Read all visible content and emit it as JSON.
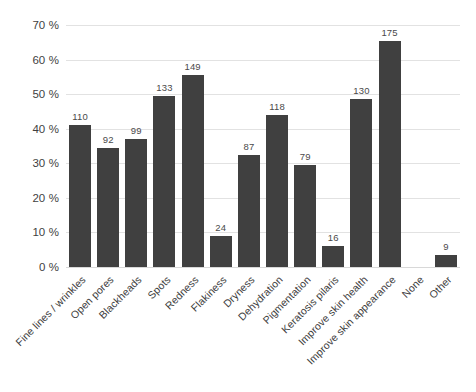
{
  "chart_data": {
    "type": "bar",
    "title": "",
    "subtitle": "",
    "xlabel": "",
    "ylabel": "",
    "ylim": [
      0,
      70
    ],
    "ytick_step": 10,
    "ytick_suffix": " %",
    "grid": true,
    "legend": "none",
    "orientation": "vertical",
    "bar_color": "#404040",
    "gridline_color": "#e2e2e2",
    "background": "#ffffff",
    "base_n": 268,
    "value_labels_shown": true,
    "categories": [
      "Fine lines / wrinkles",
      "Open pores",
      "Blackheads",
      "Spots",
      "Redness",
      "Flakiness",
      "Dryness",
      "Dehydration",
      "Pigmentation",
      "Keratosis pilaris",
      "Improve skin health",
      "Improve skin appearance",
      "None",
      "Other"
    ],
    "counts": [
      110,
      92,
      99,
      133,
      149,
      24,
      87,
      118,
      79,
      16,
      130,
      175,
      0,
      9
    ],
    "percentages": [
      41.0,
      34.3,
      36.9,
      49.6,
      55.6,
      9.0,
      32.5,
      44.0,
      29.5,
      6.0,
      48.5,
      65.3,
      0,
      3.4
    ],
    "yticks": [
      "70 %",
      "60 %",
      "50 %",
      "40 %",
      "30 %",
      "20 %",
      "10 %",
      "0 %"
    ],
    "ytick_values": [
      70,
      60,
      50,
      40,
      30,
      20,
      10,
      0
    ]
  }
}
